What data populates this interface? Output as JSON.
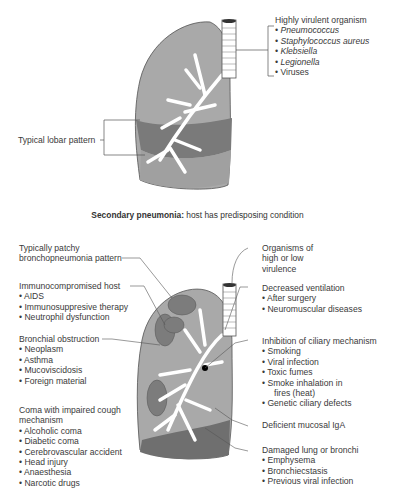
{
  "top_diagram": {
    "virulent": {
      "heading": "Highly virulent organism",
      "items": [
        "Pneumococcus",
        "Staphylococcus aureus",
        "Klebsiella",
        "Legionella",
        "Viruses"
      ]
    },
    "lobar_label": "Typical lobar pattern"
  },
  "caption": {
    "bold": "Secondary pneumonia:",
    "text": " host has predisposing condition"
  },
  "bottom_diagram": {
    "patchy": [
      "Typically patchy",
      "bronchopneumonia pattern"
    ],
    "immuno": {
      "heading": "Immunocompromised host",
      "items": [
        "AIDS",
        "Immunosuppresive therapy",
        "Neutrophil dysfunction"
      ]
    },
    "bronchial": {
      "heading": "Bronchial obstruction",
      "items": [
        "Neoplasm",
        "Asthma",
        "Mucoviscidosis",
        "Foreign material"
      ]
    },
    "coma": {
      "heading": [
        "Coma with impaired cough",
        "mechanism"
      ],
      "items": [
        "Alcoholic coma",
        "Diabetic coma",
        "Cerebrovascular accident",
        "Head injury",
        "Anaesthesia",
        "Narcotic drugs"
      ]
    },
    "organisms": [
      "Organisms of",
      "high or low",
      "virulence"
    ],
    "ventilation": {
      "heading": "Decreased ventilation",
      "items": [
        "After surgery",
        "Neuromuscular diseases"
      ]
    },
    "ciliary": {
      "heading": "Inhibition of ciliary mechanism",
      "items": [
        "Smoking",
        "Viral infection",
        "Toxic fumes",
        "Smoke inhalation in"
      ],
      "cont": "fires (heat)",
      "last": "Genetic ciliary defects"
    },
    "iga": "Deficient mucosal IgA",
    "damaged": {
      "heading": "Damaged lung or bronchi",
      "items": [
        "Emphysema",
        "Bronchiecstasis",
        "Previous viral infection"
      ]
    }
  },
  "colors": {
    "lung_light": "#a9a9a9",
    "lung_dark": "#7a7a7a",
    "outline": "#555555"
  }
}
